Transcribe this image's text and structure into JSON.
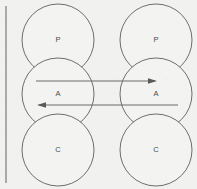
{
  "diagram": {
    "type": "node-link",
    "background_color": "#f1f1ef",
    "stroke_color": "#6e6e70",
    "label_color": "#4a4a4c",
    "arrow_color": "#5a5a5c",
    "page_edge_color": "#8a8a8c",
    "columns": [
      {
        "name": "left-column",
        "center_x": 58,
        "nodes": [
          {
            "id": "left-p",
            "label": "P",
            "cx": 58,
            "cy": 40,
            "r": 36
          },
          {
            "id": "left-a",
            "label": "A",
            "cx": 58,
            "cy": 94,
            "r": 36
          },
          {
            "id": "left-c",
            "label": "C",
            "cx": 58,
            "cy": 150,
            "r": 36
          }
        ]
      },
      {
        "name": "right-column",
        "center_x": 156,
        "nodes": [
          {
            "id": "right-p",
            "label": "P",
            "cx": 156,
            "cy": 40,
            "r": 36
          },
          {
            "id": "right-a",
            "label": "A",
            "cx": 156,
            "cy": 94,
            "r": 36
          },
          {
            "id": "right-c",
            "label": "C",
            "cx": 156,
            "cy": 150,
            "r": 36
          }
        ]
      }
    ],
    "connectors": [
      {
        "id": "arrow-left-a-to-right-a",
        "from": "left-a",
        "to": "right-a",
        "direction": "right",
        "x1": 36,
        "x2": 157,
        "y": 81
      },
      {
        "id": "arrow-right-a-to-left-a",
        "from": "right-a",
        "to": "left-a",
        "direction": "left",
        "x1": 178,
        "x2": 37,
        "y": 105
      }
    ],
    "page_edge": {
      "x": 6,
      "y1": 6,
      "y2": 183
    }
  }
}
